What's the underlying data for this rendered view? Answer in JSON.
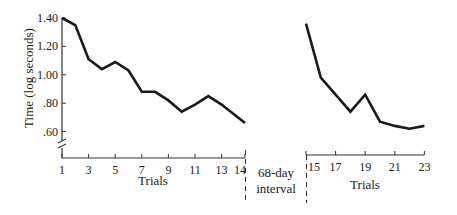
{
  "chart_data": {
    "type": "line",
    "title": "",
    "ylabel": "Time (log seconds)",
    "xlabel": "Trials",
    "ylim": [
      0.5,
      1.4
    ],
    "y_ticks": [
      ".60",
      ".80",
      "1.00",
      "1.20",
      "1.40"
    ],
    "y_tick_values": [
      0.6,
      0.8,
      1.0,
      1.2,
      1.4
    ],
    "grid": false,
    "legend": null,
    "annotation": "68-day interval",
    "panels": [
      {
        "name": "before-interval",
        "xlabel": "Trials",
        "x_ticks": [
          "1",
          "3",
          "5",
          "7",
          "9",
          "11",
          "13",
          "14"
        ],
        "x": [
          1,
          2,
          3,
          4,
          5,
          6,
          7,
          8,
          9,
          10,
          11,
          12,
          13,
          14
        ],
        "values": [
          1.4,
          1.35,
          1.11,
          1.04,
          1.09,
          1.03,
          0.88,
          0.88,
          0.82,
          0.74,
          0.79,
          0.85,
          0.79,
          0.66
        ]
      },
      {
        "name": "after-interval",
        "xlabel": "Trials",
        "x_ticks": [
          "15",
          "17",
          "19",
          "21",
          "23"
        ],
        "x": [
          15,
          16,
          17,
          18,
          19,
          20,
          21,
          22,
          23
        ],
        "values": [
          1.36,
          0.98,
          0.86,
          0.74,
          0.86,
          0.67,
          0.64,
          0.62,
          0.64
        ]
      }
    ]
  },
  "labels": {
    "ylabel": "Time (log seconds)",
    "xlabel_left": "Trials",
    "xlabel_right": "Trials",
    "interval_line1": "68-day",
    "interval_line2": "interval"
  },
  "colors": {
    "line": "#1a1a1a",
    "axis": "#333333",
    "text": "#222222"
  }
}
